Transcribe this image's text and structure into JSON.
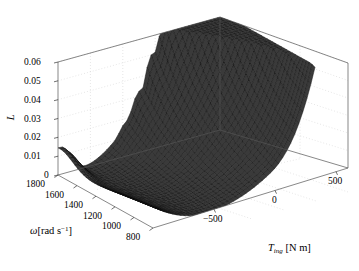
{
  "figure": {
    "background_color": "#ffffff",
    "line_color": "#4d4d4d",
    "mesh_color": "#2b2b2b",
    "grid_color": "#c8c8c8"
  },
  "chart_data": {
    "type": "surface",
    "title": "",
    "xlabel": "T_ing [N m]",
    "ylabel": "ω [rad s−1]",
    "zlabel": "L",
    "xlim": [
      -800,
      800
    ],
    "ylim": [
      800,
      1800
    ],
    "zlim": [
      0,
      0.06
    ],
    "grid": true,
    "legend": null,
    "x_ticks": [
      -500,
      0,
      500
    ],
    "x_tick_labels": [
      "−500",
      "0",
      "500"
    ],
    "y_ticks": [
      1800,
      1600,
      1400,
      1200,
      1000,
      800
    ],
    "y_tick_labels": [
      "1800",
      "1600",
      "1400",
      "1200",
      "1000",
      "800"
    ],
    "z_ticks": [
      0,
      0.01,
      0.02,
      0.03,
      0.04,
      0.05,
      0.06
    ],
    "z_tick_labels": [
      "0",
      "0.01",
      "0.02",
      "0.03",
      "0.04",
      "0.05",
      "0.06"
    ],
    "notable_values": {
      "ridge_peak_z": 0.062,
      "valley_min_z": 0.0,
      "left_edge_local_peak_z": 0.014,
      "right_front_edge_z": 0.022
    }
  },
  "axes": {
    "z_title": "L",
    "y_title_symbol": "ω",
    "y_title_unit": "[rad s",
    "y_title_exp": "−1",
    "y_title_close": "]",
    "x_title_symbol": "T",
    "x_title_sub": "ing",
    "x_title_unit": "[N m]"
  },
  "tick_text": {
    "z": [
      "0.06",
      "0.05",
      "0.04",
      "0.03",
      "0.02",
      "0.01",
      "0"
    ],
    "y": [
      "1800",
      "1600",
      "1400",
      "1200",
      "1000",
      "800"
    ],
    "x": [
      "−500",
      "0",
      "500"
    ]
  }
}
